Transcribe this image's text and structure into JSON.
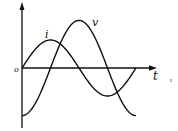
{
  "diagram": {
    "title": "",
    "origin_label": "o",
    "time_axis_label": "t",
    "stray_mark": "ı",
    "curves": [
      {
        "name": "current",
        "label": "i",
        "amplitude": 1.0,
        "phase_deg": 0,
        "cycles": 1.0
      },
      {
        "name": "voltage",
        "label": "v",
        "amplitude": 1.7,
        "phase_deg": -90,
        "cycles": 1.0
      }
    ]
  }
}
